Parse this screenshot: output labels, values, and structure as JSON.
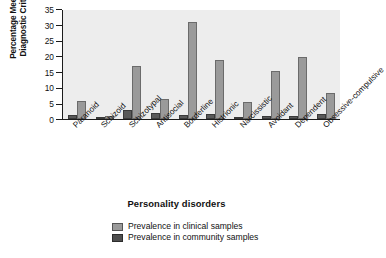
{
  "chart_data": {
    "type": "bar",
    "title": "",
    "xlabel": "Personality disorders",
    "ylabel": "Percentage Meeting Diagnostic Criteria",
    "ylabel_lines": [
      "Percentage Meeting",
      "Diagnostic Criteria"
    ],
    "ylim": [
      0,
      35
    ],
    "yticks": [
      0,
      5,
      10,
      15,
      20,
      25,
      30,
      35
    ],
    "ytick_labels": [
      "0",
      "5",
      "10",
      "15",
      "20",
      "25",
      "30",
      "35"
    ],
    "grid": false,
    "legend_position": "bottom-center",
    "categories": [
      "Paranoid",
      "Schizoid",
      "Schizotypal",
      "Antisocial",
      "Borderline",
      "Histrionic",
      "Narcissistic",
      "Avoidant",
      "Dependent",
      "Obsessive-compulsive"
    ],
    "series": [
      {
        "name": "Prevalence in community samples",
        "color": "#595959",
        "values": [
          1.3,
          0.7,
          2.8,
          1.8,
          1.2,
          1.7,
          0.2,
          1.0,
          1.0,
          1.5
        ]
      },
      {
        "name": "Prevalence in clinical samples",
        "color": "#9a9a9a",
        "values": [
          5.6,
          0.9,
          16.9,
          6.5,
          31.0,
          18.8,
          5.4,
          15.4,
          19.8,
          8.2
        ]
      }
    ]
  },
  "legend": {
    "items": [
      {
        "label": "Prevalence in clinical samples",
        "swatch": "clinical"
      },
      {
        "label": "Prevalence in community samples",
        "swatch": "community"
      }
    ]
  },
  "axis": {
    "y_title_line1": "Percentage Meeting",
    "y_title_line2": "Diagnostic Criteria",
    "x_title": "Personality disorders"
  },
  "colors": {
    "plot_background": "#ededed",
    "page_background": "#ffffff",
    "axis": "#1c1c1c",
    "clinical_bar": "#9a9a9a",
    "community_bar": "#595959"
  }
}
